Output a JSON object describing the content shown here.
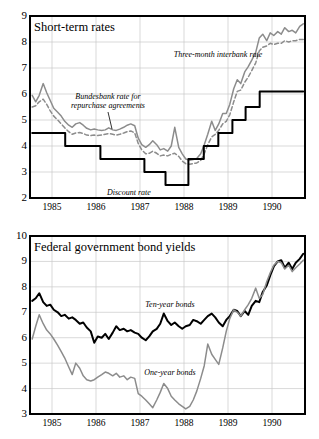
{
  "figure": {
    "background": "#ffffff",
    "ink": "#000000",
    "grey_series_color": "#8c8c8c",
    "grid_color": "#c9c9c9"
  },
  "charts": [
    {
      "id": "short-term-rates",
      "title": "Short-term rates",
      "ylim": [
        2,
        9
      ],
      "yticks": [
        "2",
        "3",
        "4",
        "5",
        "6",
        "7",
        "8",
        "9"
      ],
      "xticks": [
        "1985",
        "1986",
        "1987",
        "1988",
        "1989",
        "1990"
      ],
      "annotations": [
        {
          "name": "three-month-interbank-rate",
          "text": "Three-month interbank rate"
        },
        {
          "name": "bundesbank-repo-rate",
          "line1": "Bundesbank rate for",
          "line2": "repurchase agreements"
        },
        {
          "name": "discount-rate",
          "text": "Discount rate"
        }
      ]
    },
    {
      "id": "federal-government-bond-yields",
      "title": "Federal government bond yields",
      "ylim": [
        3,
        10
      ],
      "yticks": [
        "3",
        "4",
        "5",
        "6",
        "7",
        "8",
        "9",
        "10"
      ],
      "xticks": [
        "1985",
        "1986",
        "1987",
        "1988",
        "1989",
        "1990"
      ],
      "annotations": [
        {
          "name": "ten-year-bonds",
          "text": "Ten-year bonds"
        },
        {
          "name": "one-year-bonds",
          "text": "One-year bonds"
        }
      ]
    }
  ],
  "chart_data": [
    {
      "type": "line",
      "id": "short-term-rates",
      "title": "Short-term rates",
      "xlabel": "",
      "ylabel": "",
      "ylim": [
        2,
        9
      ],
      "xlim": [
        1984.5,
        1990.75
      ],
      "grid": true,
      "legend": "inline-annotations",
      "xtick_values": [
        1985,
        1986,
        1987,
        1988,
        1989,
        1990
      ],
      "xtick_labels": [
        "1985",
        "1986",
        "1987",
        "1988",
        "1989",
        "1990"
      ],
      "ytick_values": [
        2,
        3,
        4,
        5,
        6,
        7,
        8,
        9
      ],
      "series": [
        {
          "name": "Three-month interbank rate",
          "style": "solid",
          "color": "#8c8c8c",
          "x": [
            1984.55,
            1984.63,
            1984.71,
            1984.8,
            1984.88,
            1984.96,
            1985.04,
            1985.13,
            1985.21,
            1985.29,
            1985.38,
            1985.46,
            1985.54,
            1985.63,
            1985.71,
            1985.79,
            1985.88,
            1985.96,
            1986.04,
            1986.13,
            1986.21,
            1986.29,
            1986.38,
            1986.46,
            1986.54,
            1986.63,
            1986.71,
            1986.79,
            1986.88,
            1986.96,
            1987.04,
            1987.13,
            1987.21,
            1987.29,
            1987.38,
            1987.46,
            1987.54,
            1987.63,
            1987.71,
            1987.79,
            1987.88,
            1987.96,
            1988.04,
            1988.13,
            1988.21,
            1988.29,
            1988.38,
            1988.46,
            1988.54,
            1988.63,
            1988.71,
            1988.79,
            1988.88,
            1988.96,
            1989.04,
            1989.13,
            1989.21,
            1989.29,
            1989.38,
            1989.46,
            1989.54,
            1989.63,
            1989.71,
            1989.79,
            1989.88,
            1989.96,
            1990.04,
            1990.13,
            1990.21,
            1990.29,
            1990.38,
            1990.46,
            1990.54,
            1990.63,
            1990.71
          ],
          "y": [
            5.95,
            5.7,
            5.95,
            6.4,
            6.05,
            5.75,
            5.45,
            5.3,
            5.15,
            4.95,
            4.8,
            4.72,
            4.85,
            4.9,
            4.8,
            4.68,
            4.62,
            4.65,
            4.62,
            4.6,
            4.62,
            4.7,
            4.62,
            4.6,
            4.65,
            4.72,
            4.8,
            4.85,
            4.78,
            4.3,
            4.05,
            3.95,
            4.05,
            4.2,
            4.05,
            3.85,
            3.9,
            3.8,
            4.0,
            4.72,
            3.95,
            3.7,
            3.5,
            3.45,
            3.48,
            3.52,
            3.7,
            4.05,
            4.45,
            4.95,
            4.6,
            4.85,
            5.25,
            5.25,
            5.6,
            6.2,
            6.55,
            6.4,
            6.85,
            7.05,
            7.3,
            7.6,
            8.15,
            8.3,
            8.05,
            8.35,
            8.25,
            8.4,
            8.3,
            8.55,
            8.4,
            8.45,
            8.35,
            8.6,
            8.7
          ]
        },
        {
          "name": "Bundesbank rate for repurchase agreements",
          "style": "dashed",
          "color": "#8c8c8c",
          "x": [
            1984.55,
            1984.63,
            1984.71,
            1984.8,
            1984.88,
            1984.96,
            1985.04,
            1985.13,
            1985.21,
            1985.29,
            1985.38,
            1985.46,
            1985.54,
            1985.63,
            1985.71,
            1985.79,
            1985.88,
            1985.96,
            1986.04,
            1986.13,
            1986.21,
            1986.29,
            1986.38,
            1986.46,
            1986.54,
            1986.63,
            1986.71,
            1986.79,
            1986.88,
            1986.96,
            1987.04,
            1987.13,
            1987.21,
            1987.29,
            1987.38,
            1987.46,
            1987.54,
            1987.63,
            1987.71,
            1987.79,
            1987.88,
            1987.96,
            1988.04,
            1988.13,
            1988.21,
            1988.29,
            1988.38,
            1988.46,
            1988.54,
            1988.63,
            1988.71,
            1988.79,
            1988.88,
            1988.96,
            1989.04,
            1989.13,
            1989.21,
            1989.29,
            1989.38,
            1989.46,
            1989.54,
            1989.63,
            1989.71,
            1989.79,
            1989.88,
            1989.96,
            1990.04,
            1990.13,
            1990.21,
            1990.29,
            1990.38,
            1990.46,
            1990.54,
            1990.63,
            1990.71
          ],
          "y": [
            5.5,
            5.55,
            5.7,
            5.8,
            5.6,
            5.35,
            5.15,
            5.0,
            4.85,
            4.7,
            4.55,
            4.45,
            4.5,
            4.52,
            4.48,
            4.42,
            4.4,
            4.42,
            4.4,
            4.42,
            4.45,
            4.48,
            4.45,
            4.42,
            4.45,
            4.5,
            4.55,
            4.58,
            4.5,
            4.1,
            3.85,
            3.7,
            3.72,
            3.8,
            3.72,
            3.62,
            3.65,
            3.62,
            3.68,
            3.72,
            3.6,
            3.42,
            3.32,
            3.3,
            3.32,
            3.35,
            3.45,
            3.7,
            4.05,
            4.35,
            4.45,
            4.6,
            4.85,
            4.95,
            5.2,
            5.7,
            6.1,
            6.15,
            6.45,
            6.65,
            6.9,
            7.2,
            7.65,
            7.8,
            7.85,
            7.95,
            7.9,
            7.95,
            7.95,
            8.05,
            8.0,
            8.05,
            8.05,
            8.1,
            8.1
          ]
        },
        {
          "name": "Discount rate",
          "style": "step",
          "color": "#000000",
          "x": [
            1984.55,
            1985.3,
            1985.3,
            1986.1,
            1986.1,
            1986.6,
            1986.6,
            1987.1,
            1987.1,
            1987.58,
            1987.58,
            1988.1,
            1988.1,
            1988.45,
            1988.45,
            1988.78,
            1988.78,
            1989.1,
            1989.1,
            1989.4,
            1989.4,
            1989.72,
            1989.72,
            1990.71
          ],
          "y": [
            4.5,
            4.5,
            4.0,
            4.0,
            3.5,
            3.5,
            3.5,
            3.5,
            3.0,
            3.0,
            2.5,
            2.5,
            3.5,
            3.5,
            4.0,
            4.0,
            4.5,
            4.5,
            5.0,
            5.0,
            5.5,
            5.5,
            6.1,
            6.1
          ]
        }
      ]
    },
    {
      "type": "line",
      "id": "federal-government-bond-yields",
      "title": "Federal government bond yields",
      "xlabel": "",
      "ylabel": "",
      "ylim": [
        3,
        10
      ],
      "xlim": [
        1984.5,
        1990.75
      ],
      "grid": true,
      "legend": "inline-annotations",
      "xtick_values": [
        1985,
        1986,
        1987,
        1988,
        1989,
        1990
      ],
      "xtick_labels": [
        "1985",
        "1986",
        "1987",
        "1988",
        "1989",
        "1990"
      ],
      "ytick_values": [
        3,
        4,
        5,
        6,
        7,
        8,
        9,
        10
      ],
      "series": [
        {
          "name": "Ten-year bonds",
          "style": "solid",
          "color": "#000000",
          "x": [
            1984.55,
            1984.63,
            1984.71,
            1984.8,
            1984.88,
            1984.96,
            1985.04,
            1985.13,
            1985.21,
            1985.29,
            1985.38,
            1985.46,
            1985.54,
            1985.63,
            1985.71,
            1985.79,
            1985.88,
            1985.96,
            1986.04,
            1986.13,
            1986.21,
            1986.29,
            1986.38,
            1986.46,
            1986.54,
            1986.63,
            1986.71,
            1986.79,
            1986.88,
            1986.96,
            1987.04,
            1987.13,
            1987.21,
            1987.29,
            1987.38,
            1987.46,
            1987.54,
            1987.63,
            1987.71,
            1987.79,
            1987.88,
            1987.96,
            1988.04,
            1988.13,
            1988.21,
            1988.29,
            1988.38,
            1988.46,
            1988.54,
            1988.63,
            1988.71,
            1988.79,
            1988.88,
            1988.96,
            1989.04,
            1989.13,
            1989.21,
            1989.29,
            1989.38,
            1989.46,
            1989.54,
            1989.63,
            1989.71,
            1989.79,
            1989.88,
            1989.96,
            1990.04,
            1990.13,
            1990.21,
            1990.29,
            1990.38,
            1990.46,
            1990.54,
            1990.63,
            1990.71
          ],
          "y": [
            7.45,
            7.55,
            7.75,
            7.4,
            7.25,
            7.3,
            7.1,
            7.0,
            6.85,
            6.9,
            6.75,
            6.8,
            6.7,
            6.55,
            6.6,
            6.4,
            6.25,
            5.8,
            6.05,
            6.0,
            6.15,
            5.95,
            6.2,
            6.45,
            6.3,
            6.35,
            6.25,
            6.3,
            6.2,
            6.15,
            6.0,
            5.9,
            6.05,
            6.25,
            6.35,
            6.55,
            6.95,
            6.65,
            6.5,
            6.6,
            6.45,
            6.35,
            6.45,
            6.5,
            6.7,
            6.65,
            6.55,
            6.7,
            6.85,
            6.95,
            6.8,
            6.6,
            6.45,
            6.7,
            6.85,
            7.1,
            7.05,
            6.85,
            7.05,
            6.9,
            7.25,
            7.45,
            7.4,
            7.8,
            8.05,
            8.45,
            8.8,
            9.0,
            9.05,
            8.75,
            8.95,
            8.7,
            8.95,
            9.1,
            9.3
          ]
        },
        {
          "name": "One-year bonds",
          "style": "solid",
          "color": "#8c8c8c",
          "x": [
            1984.55,
            1984.63,
            1984.71,
            1984.8,
            1984.88,
            1984.96,
            1985.04,
            1985.13,
            1985.21,
            1985.29,
            1985.38,
            1985.46,
            1985.54,
            1985.63,
            1985.71,
            1985.79,
            1985.88,
            1985.96,
            1986.04,
            1986.13,
            1986.21,
            1986.29,
            1986.38,
            1986.46,
            1986.54,
            1986.63,
            1986.71,
            1986.79,
            1986.88,
            1986.96,
            1987.04,
            1987.13,
            1987.21,
            1987.29,
            1987.38,
            1987.46,
            1987.54,
            1987.63,
            1987.71,
            1987.79,
            1987.88,
            1987.96,
            1988.04,
            1988.13,
            1988.21,
            1988.29,
            1988.38,
            1988.46,
            1988.54,
            1988.63,
            1988.71,
            1988.79,
            1988.88,
            1988.96,
            1989.04,
            1989.13,
            1989.21,
            1989.29,
            1989.38,
            1989.46,
            1989.54,
            1989.63,
            1989.71,
            1989.79,
            1989.88,
            1989.96,
            1990.04,
            1990.13,
            1990.21,
            1990.29,
            1990.38,
            1990.46,
            1990.54,
            1990.63,
            1990.71
          ],
          "y": [
            5.95,
            6.45,
            6.9,
            6.55,
            6.3,
            6.15,
            5.95,
            5.7,
            5.45,
            5.2,
            4.85,
            4.55,
            5.0,
            4.8,
            4.5,
            4.35,
            4.3,
            4.35,
            4.45,
            4.55,
            4.65,
            4.6,
            4.5,
            4.6,
            4.45,
            4.5,
            4.35,
            4.45,
            4.4,
            3.8,
            3.7,
            3.55,
            3.4,
            3.25,
            3.55,
            3.85,
            4.2,
            4.0,
            3.7,
            3.55,
            3.4,
            3.3,
            3.2,
            3.3,
            3.55,
            3.9,
            4.4,
            4.9,
            5.75,
            5.35,
            5.15,
            4.95,
            5.6,
            6.25,
            6.75,
            7.1,
            7.0,
            6.85,
            7.1,
            7.3,
            7.55,
            7.95,
            7.55,
            7.7,
            8.2,
            8.55,
            8.85,
            9.0,
            8.95,
            8.7,
            8.85,
            8.6,
            8.75,
            8.9,
            9.05
          ]
        }
      ]
    }
  ]
}
